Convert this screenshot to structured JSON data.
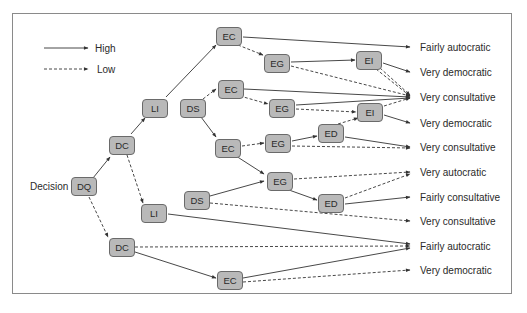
{
  "legend": {
    "high_label": "High",
    "low_label": "Low"
  },
  "root_label": "Decision",
  "nodes": {
    "dq": "DQ",
    "dc_high": "DC",
    "dc_low": "DC",
    "li_high": "LI",
    "li_low": "LI",
    "ds_top": "DS",
    "ds_bottom": "DS",
    "ec1": "EC",
    "ec2": "EC",
    "ec3": "EC",
    "ec4": "EC",
    "eg1": "EG",
    "eg2": "EG",
    "eg3": "EG",
    "eg4": "EG",
    "ei1": "EI",
    "ei2": "EI",
    "ed1": "ED",
    "ed2": "ED"
  },
  "outcomes": [
    "Fairly autocratic",
    "Very democratic",
    "Very consultative",
    "Very democratic",
    "Very consultative",
    "Very autocratic",
    "Fairly consultative",
    "Very consultative",
    "Fairly autocratic",
    "Very democratic"
  ],
  "colors": {
    "node_fill": "#b9b9b9",
    "node_border": "#6a6a6a",
    "line": "#333333",
    "frame": "#8a8a8a"
  }
}
